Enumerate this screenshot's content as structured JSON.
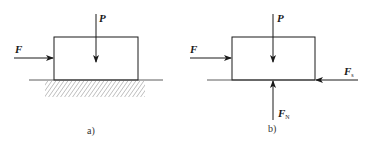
{
  "diagrams": [
    {
      "id": "a",
      "caption": "a)",
      "forces": {
        "applied": {
          "symbol": "F",
          "subscript": ""
        },
        "weight": {
          "symbol": "P",
          "subscript": ""
        }
      },
      "support": "hatched-ground"
    },
    {
      "id": "b",
      "caption": "b)",
      "forces": {
        "applied": {
          "symbol": "F",
          "subscript": ""
        },
        "weight": {
          "symbol": "P",
          "subscript": ""
        },
        "friction": {
          "symbol": "F",
          "subscript": "s"
        },
        "normal": {
          "symbol": "F",
          "subscript": "N"
        }
      },
      "support": "free-body"
    }
  ],
  "colors": {
    "line": "#1a1a1a",
    "hatch": "#555555",
    "background": "#ffffff"
  }
}
